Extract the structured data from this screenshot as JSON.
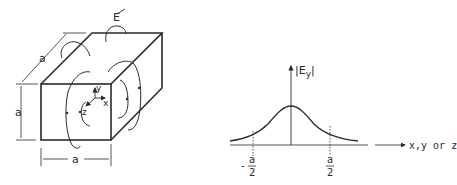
{
  "cube": {
    "dimension_label_depth": "a",
    "dimension_label_height": "a",
    "dimension_label_width": "a",
    "field_label": "E",
    "axis_x": "x",
    "axis_y": "y",
    "axis_z": "z"
  },
  "graph": {
    "y_axis_label": "|Ey|",
    "y_axis_label_main": "|E",
    "y_axis_label_sub": "y",
    "y_axis_label_end": "|",
    "x_axis_label": "x,y or z",
    "tick_left_sign": "-",
    "tick_left_num": "a",
    "tick_left_den": "2",
    "tick_right_num": "a",
    "tick_right_den": "2"
  },
  "colors": {
    "ink": "#2a2a2a",
    "background": "#ffffff"
  }
}
